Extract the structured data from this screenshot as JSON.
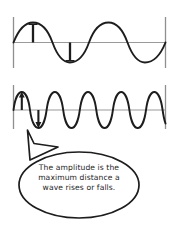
{
  "image": {
    "title": "Amplitude of a wave diagram",
    "background_color": "#ffffff",
    "ink_color": "#1d1d1d",
    "axis_color": "#8a8a8a",
    "width": 178,
    "height": 229
  },
  "panels": [
    {
      "name": "low-frequency-wave",
      "description": "Sine wave with two full cycles and large wavelength",
      "cycles": 2,
      "amplitude_markers": [
        {
          "name": "crest-marker",
          "direction": "up",
          "position": "first crest"
        },
        {
          "name": "trough-marker",
          "direction": "down",
          "position": "first trough"
        }
      ]
    },
    {
      "name": "high-frequency-wave",
      "description": "Sine wave with six full cycles and short wavelength",
      "cycles": 6,
      "amplitude_markers": [
        {
          "name": "crest-arrow",
          "direction": "up",
          "position": "first crest"
        },
        {
          "name": "trough-arrow",
          "direction": "down",
          "position": "first trough"
        }
      ]
    }
  ],
  "callout": {
    "name": "amplitude-definition-bubble",
    "shape": "oval-speech-bubble",
    "tail_points_to": "high-frequency-wave",
    "lines": [
      "The amplitude is the",
      "maximum distance a",
      "wave rises or falls."
    ],
    "full_text": "The amplitude is the maximum distance a wave rises or falls."
  }
}
